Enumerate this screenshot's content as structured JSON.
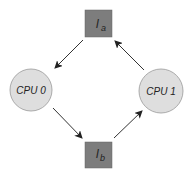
{
  "diagram": {
    "nodes": [
      {
        "id": "la",
        "label_main": "l",
        "label_sub": "a",
        "shape": "square",
        "fill": "#7a7a7a"
      },
      {
        "id": "cpu0",
        "label": "CPU 0",
        "shape": "circle",
        "fill": "#dedede"
      },
      {
        "id": "cpu1",
        "label": "CPU 1",
        "shape": "circle",
        "fill": "#dedede"
      },
      {
        "id": "lb",
        "label_main": "l",
        "label_sub": "b",
        "shape": "square",
        "fill": "#7a7a7a"
      }
    ],
    "edges": [
      {
        "from": "la",
        "to": "cpu0"
      },
      {
        "from": "cpu0",
        "to": "lb"
      },
      {
        "from": "lb",
        "to": "cpu1"
      },
      {
        "from": "cpu1",
        "to": "la"
      }
    ]
  }
}
